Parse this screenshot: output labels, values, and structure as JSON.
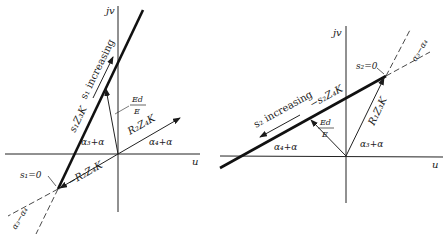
{
  "left_diagram": {
    "axis_vertical": "jv",
    "axis_horizontal": "u",
    "thick_line_label": "s₁Z₃K",
    "direction_label": "s₁ increasing",
    "fraction": {
      "num": "Ed",
      "den": "E"
    },
    "vector_label": "R₂Z₄K",
    "neg_vector_label": "−R₂Z₄K",
    "zero_point_label": "s₁=0",
    "angle_a3": "α₃+α",
    "angle_a4": "α₄+α",
    "angle_diff": "α₃−α₄"
  },
  "right_diagram": {
    "axis_vertical": "jv",
    "axis_horizontal": "u",
    "thick_line_label": "−s₂Z₄K",
    "direction_label": "s₂ increasing",
    "fraction": {
      "num": "Ed",
      "den": "E"
    },
    "vector_label": "R₁Z₃K",
    "zero_point_label": "s₂=0",
    "angle_a3": "α₃+α",
    "angle_a4": "α₄+α",
    "angle_diff": "α₃−α₄"
  }
}
